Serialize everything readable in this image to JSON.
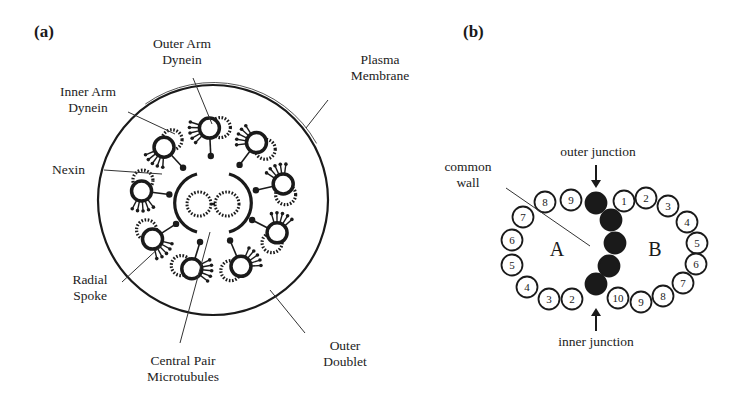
{
  "panels": {
    "a": {
      "label": "(a)",
      "title": "Axoneme cross-section (9+2 structure)",
      "labels": {
        "outer_arm_dynein_1": "Outer Arm",
        "outer_arm_dynein_2": "Dynein",
        "inner_arm_dynein_1": "Inner Arm",
        "inner_arm_dynein_2": "Dynein",
        "plasma_membrane_1": "Plasma",
        "plasma_membrane_2": "Membrane",
        "nexin": "Nexin",
        "radial_spoke_1": "Radial",
        "radial_spoke_2": "Spoke",
        "central_pair_1": "Central Pair",
        "central_pair_2": "Microtubules",
        "outer_doublet_1": "Outer",
        "outer_doublet_2": "Doublet",
        "tubule_a": "A",
        "tubule_b": "B"
      },
      "doublet_count": 9,
      "central_pair_count": 2
    },
    "b": {
      "label": "(b)",
      "title": "Microtubule doublet protofilaments",
      "labels": {
        "common_wall_1": "common",
        "common_wall_2": "wall",
        "outer_junction": "outer junction",
        "inner_junction": "inner junction",
        "tubule_a": "A",
        "tubule_b": "B"
      },
      "a_tubule_numbers": [
        "2",
        "3",
        "4",
        "5",
        "6",
        "7",
        "8",
        "9"
      ],
      "b_tubule_numbers": [
        "1",
        "2",
        "3",
        "4",
        "5",
        "6",
        "7",
        "8",
        "9",
        "10"
      ],
      "shared_protofilaments": 5
    }
  }
}
